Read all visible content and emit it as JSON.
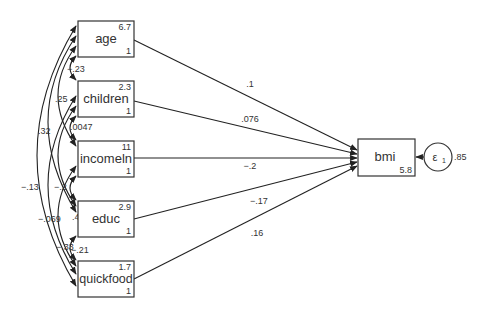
{
  "diagram": {
    "type": "path-diagram",
    "exogenous": [
      {
        "name": "age",
        "mean": "6.7",
        "var": "1"
      },
      {
        "name": "children",
        "mean": "2.3",
        "var": "1"
      },
      {
        "name": "incomeln",
        "mean": "11",
        "var": "1"
      },
      {
        "name": "educ",
        "mean": "2.9",
        "var": "1"
      },
      {
        "name": "quickfood",
        "mean": "1.7",
        "var": "1"
      }
    ],
    "endogenous": {
      "name": "bmi",
      "intercept": "5.8"
    },
    "error": {
      "symbol": "ε",
      "subscript": "1",
      "variance": ".85"
    },
    "paths": [
      {
        "from": "age",
        "to": "bmi",
        "coef": ".1"
      },
      {
        "from": "children",
        "to": "bmi",
        "coef": ".076"
      },
      {
        "from": "incomeln",
        "to": "bmi",
        "coef": "−.2"
      },
      {
        "from": "educ",
        "to": "bmi",
        "coef": "−.17"
      },
      {
        "from": "quickfood",
        "to": "bmi",
        "coef": ".16"
      }
    ],
    "covariances": [
      {
        "a": "age",
        "b": "children",
        "value": "−.23"
      },
      {
        "a": "age",
        "b": "incomeln",
        "value": ".25"
      },
      {
        "a": "age",
        "b": "educ",
        "value": ".32"
      },
      {
        "a": "age",
        "b": "quickfood",
        "value": "−.13"
      },
      {
        "a": "children",
        "b": "incomeln",
        "value": ".0047"
      },
      {
        "a": "children",
        "b": "educ",
        "value": "−.2"
      },
      {
        "a": "children",
        "b": "quickfood",
        "value": "−.069"
      },
      {
        "a": "incomeln",
        "b": "educ",
        "value": ".48"
      },
      {
        "a": "incomeln",
        "b": "quickfood",
        "value": "−.33"
      },
      {
        "a": "educ",
        "b": "quickfood",
        "value": "−.21"
      }
    ]
  }
}
